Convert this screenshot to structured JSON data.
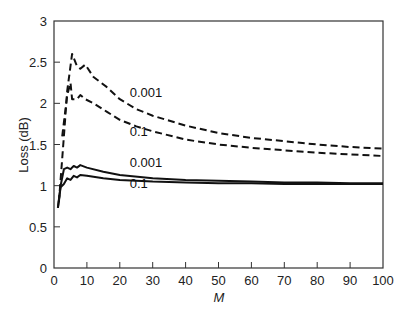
{
  "chart_data": {
    "type": "line",
    "title": "",
    "xlabel": "M",
    "ylabel": "Loss (dB)",
    "xlim": [
      0,
      100
    ],
    "ylim": [
      0,
      3
    ],
    "xticks": [
      0,
      10,
      20,
      30,
      40,
      50,
      60,
      70,
      80,
      90,
      100
    ],
    "yticks": [
      0,
      0.5,
      1,
      1.5,
      2,
      2.5,
      3
    ],
    "ytick_labels": [
      "0",
      "0.5",
      "1",
      "1.5",
      "2",
      "2.5",
      "3"
    ],
    "grid": false,
    "legend": "inline curve labels",
    "series": [
      {
        "name": "0.001 (dashed)",
        "style": "dashed",
        "label": "0.001",
        "label_pos": [
          23,
          2.08
        ],
        "x": [
          1.5,
          3,
          4,
          5.5,
          7,
          8,
          9.5,
          12,
          16,
          20,
          25,
          30,
          40,
          50,
          60,
          70,
          80,
          90,
          100
        ],
        "y": [
          0.8,
          1.6,
          2.15,
          2.6,
          2.45,
          2.42,
          2.47,
          2.32,
          2.2,
          2.05,
          1.93,
          1.85,
          1.73,
          1.64,
          1.58,
          1.54,
          1.5,
          1.47,
          1.45
        ]
      },
      {
        "name": "0.1 (dashed)",
        "style": "dashed",
        "label": "0.1",
        "label_pos": [
          23,
          1.6
        ],
        "x": [
          2.5,
          4,
          5,
          5.5,
          7,
          8,
          9.5,
          12,
          16,
          20,
          25,
          30,
          40,
          50,
          60,
          70,
          80,
          90,
          100
        ],
        "y": [
          1.6,
          2.1,
          2.25,
          2.05,
          2.05,
          2.1,
          2.05,
          2.0,
          1.9,
          1.8,
          1.72,
          1.66,
          1.56,
          1.5,
          1.46,
          1.43,
          1.4,
          1.38,
          1.36
        ]
      },
      {
        "name": "0.001 (solid)",
        "style": "solid",
        "label": "0.001",
        "label_pos": [
          23,
          1.23
        ],
        "x": [
          1.2,
          2,
          3,
          4,
          5,
          6,
          7,
          8,
          10,
          15,
          20,
          30,
          40,
          50,
          60,
          70,
          80,
          90,
          100
        ],
        "y": [
          0.73,
          1.0,
          1.2,
          1.22,
          1.2,
          1.24,
          1.22,
          1.25,
          1.22,
          1.17,
          1.13,
          1.09,
          1.07,
          1.06,
          1.05,
          1.04,
          1.04,
          1.03,
          1.03
        ]
      },
      {
        "name": "0.1 (solid)",
        "style": "solid",
        "label": "0.1",
        "label_pos": [
          23,
          0.97
        ],
        "x": [
          1.2,
          2,
          3,
          4,
          5,
          6,
          7,
          8,
          10,
          15,
          20,
          30,
          40,
          50,
          60,
          70,
          80,
          90,
          100
        ],
        "y": [
          0.73,
          0.98,
          1.02,
          1.09,
          1.07,
          1.12,
          1.1,
          1.13,
          1.12,
          1.09,
          1.07,
          1.05,
          1.04,
          1.03,
          1.03,
          1.02,
          1.02,
          1.02,
          1.02
        ]
      }
    ]
  }
}
